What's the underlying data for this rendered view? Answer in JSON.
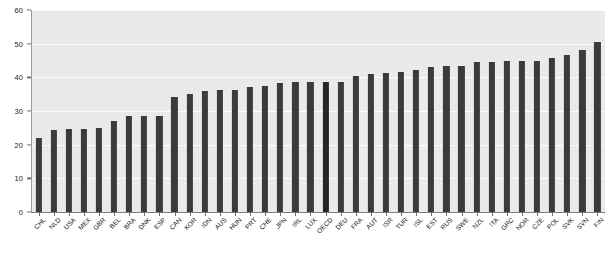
{
  "chart_data": {
    "type": "bar",
    "title": "",
    "subtitle": "",
    "xlabel": "",
    "ylabel": "",
    "ylim": [
      0,
      60
    ],
    "yticks": [
      0,
      10,
      20,
      30,
      40,
      50,
      60
    ],
    "ytick_labels": [
      "0",
      "10",
      "20",
      "30",
      "40",
      "50",
      "60"
    ],
    "grid": true,
    "grid_axis": "y",
    "legend": "none",
    "orientation": "vertical",
    "sorted": "ascending",
    "highlight_category": "OECD",
    "bar_color": "#3b3b3b",
    "highlight_color": "#262626",
    "plot_background": "#eaeaea",
    "gridline_color": "#fdfdfd",
    "axis_color": "#7d7d7d",
    "categories": [
      "CHL",
      "NLD",
      "USA",
      "MEX",
      "GBR",
      "BEL",
      "BRA",
      "DNK",
      "ESP",
      "CAN",
      "KOR",
      "IDN",
      "AUS",
      "HUN",
      "PRT",
      "CHE",
      "JPN",
      "IRL",
      "LUX",
      "OECD",
      "DEU",
      "FRA",
      "AUT",
      "ISR",
      "TUR",
      "ISL",
      "EST",
      "RUS",
      "SWE",
      "NZL",
      "ITA",
      "GRC",
      "NOR",
      "CZE",
      "POL",
      "SVK",
      "SVN",
      "FIN"
    ],
    "values": [
      22.1,
      24.4,
      24.7,
      24.8,
      25.0,
      27.0,
      28.4,
      28.5,
      28.6,
      34.2,
      35.2,
      36.0,
      36.2,
      36.2,
      37.0,
      37.4,
      38.4,
      38.5,
      38.6,
      38.6,
      38.7,
      40.4,
      41.0,
      41.3,
      41.7,
      42.1,
      43.0,
      43.3,
      43.4,
      44.7,
      44.7,
      44.8,
      44.8,
      45.0,
      45.7,
      46.7,
      48.0,
      50.5
    ],
    "bar_count": 38
  },
  "axes": {
    "y_axis_name": "value-axis",
    "x_axis_name": "country-axis"
  }
}
